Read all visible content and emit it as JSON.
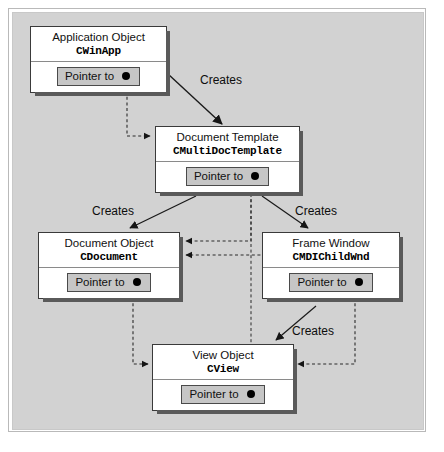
{
  "diagram": {
    "background_color": "#d2d2d2",
    "nodes": [
      {
        "id": "app",
        "title": "Application Object",
        "class_name": "CWinApp",
        "pointer_label": "Pointer to",
        "pointer_icon": "filled-circle-icon"
      },
      {
        "id": "template",
        "title": "Document Template",
        "class_name": "CMultiDocTemplate",
        "pointer_label": "Pointer to",
        "pointer_icon": "filled-circle-icon"
      },
      {
        "id": "document",
        "title": "Document Object",
        "class_name": "CDocument",
        "pointer_label": "Pointer to",
        "pointer_icon": "filled-circle-icon"
      },
      {
        "id": "frame",
        "title": "Frame Window",
        "class_name": "CMDIChildWnd",
        "pointer_label": "Pointer to",
        "pointer_icon": "filled-circle-icon"
      },
      {
        "id": "view",
        "title": "View Object",
        "class_name": "CView",
        "pointer_label": "Pointer to",
        "pointer_icon": "filled-circle-icon"
      }
    ],
    "edges": [
      {
        "id": "creates-1",
        "label": "Creates",
        "style": "solid",
        "from": "app",
        "to": "template"
      },
      {
        "id": "creates-2",
        "label": "Creates",
        "style": "solid",
        "from": "template",
        "to": "document"
      },
      {
        "id": "creates-3",
        "label": "Creates",
        "style": "solid",
        "from": "template",
        "to": "frame"
      },
      {
        "id": "creates-4",
        "label": "Creates",
        "style": "solid",
        "from": "frame",
        "to": "view"
      },
      {
        "id": "ptr-app-template",
        "label": "",
        "style": "dashed",
        "from": "app",
        "to": "template"
      },
      {
        "id": "ptr-template-document",
        "label": "",
        "style": "dashed",
        "from": "template",
        "to": "document"
      },
      {
        "id": "ptr-template-view",
        "label": "",
        "style": "dashed",
        "from": "template",
        "to": "view"
      },
      {
        "id": "ptr-document-view",
        "label": "",
        "style": "dashed",
        "from": "document",
        "to": "view"
      },
      {
        "id": "ptr-frame-document",
        "label": "",
        "style": "dashed",
        "from": "frame",
        "to": "document"
      },
      {
        "id": "ptr-frame-view",
        "label": "",
        "style": "dashed",
        "from": "frame",
        "to": "view"
      }
    ]
  }
}
